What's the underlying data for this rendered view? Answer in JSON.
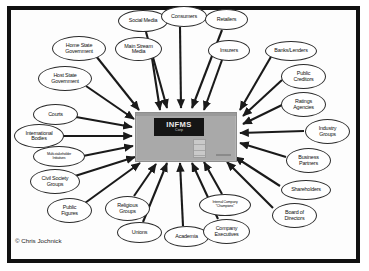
{
  "diagram": {
    "type": "stakeholder-map",
    "credit": "© Chris Jochnick",
    "frame_color": "#111111",
    "background_color": "#ffffff",
    "arrow_color": "#1a1a1a",
    "hub_color": "#a9a9a9",
    "hub": {
      "name": "INFMS",
      "sub": "Corp",
      "sign_background": "#151515",
      "sign_text_color": "#e9e9e9"
    },
    "nodes": [
      {
        "id": "social-media",
        "label": "Social Media",
        "x": 118,
        "y": 10,
        "w": 50,
        "h": 22,
        "size": "n-sm"
      },
      {
        "id": "consumers",
        "label": "Consumers",
        "x": 161,
        "y": 6,
        "w": 46,
        "h": 21,
        "size": "n-sm"
      },
      {
        "id": "retailers",
        "label": "Retailers",
        "x": 205,
        "y": 9,
        "w": 43,
        "h": 21,
        "size": "n-sm"
      },
      {
        "id": "main-stream-media",
        "label": "Main Stream\nMedia",
        "x": 115,
        "y": 37,
        "w": 47,
        "h": 24,
        "size": "n-sm"
      },
      {
        "id": "insurers",
        "label": "Insurers",
        "x": 208,
        "y": 40,
        "w": 42,
        "h": 21,
        "size": "n-sm"
      },
      {
        "id": "banks-lenders",
        "label": "Banks/Lenders",
        "x": 265,
        "y": 41,
        "w": 52,
        "h": 20,
        "size": "n-sm"
      },
      {
        "id": "public-creditors",
        "label": "Public\nCreditors",
        "x": 281,
        "y": 64,
        "w": 45,
        "h": 25,
        "size": "n-sm"
      },
      {
        "id": "ratings-agencies",
        "label": "Ratings\nAgencies",
        "x": 281,
        "y": 92,
        "w": 45,
        "h": 25,
        "size": "n-sm"
      },
      {
        "id": "industry-groups",
        "label": "Industry\nGroups",
        "x": 305,
        "y": 119,
        "w": 45,
        "h": 25,
        "size": "n-sm"
      },
      {
        "id": "business-partners",
        "label": "Business\nPartners",
        "x": 286,
        "y": 148,
        "w": 45,
        "h": 25,
        "size": "n-sm"
      },
      {
        "id": "shareholders",
        "label": "Shareholders",
        "x": 281,
        "y": 180,
        "w": 50,
        "h": 20,
        "size": "n-sm"
      },
      {
        "id": "board-of-directors",
        "label": "Board of\nDirectors",
        "x": 272,
        "y": 203,
        "w": 45,
        "h": 25,
        "size": "n-sm"
      },
      {
        "id": "home-state-government",
        "label": "Home State\nGovernment",
        "x": 52,
        "y": 36,
        "w": 54,
        "h": 25,
        "size": "n-sm"
      },
      {
        "id": "host-state-government",
        "label": "Host State\nGovernment",
        "x": 38,
        "y": 66,
        "w": 54,
        "h": 25,
        "size": "n-sm"
      },
      {
        "id": "courts",
        "label": "Courts",
        "x": 33,
        "y": 104,
        "w": 45,
        "h": 21,
        "size": "n-sm"
      },
      {
        "id": "international-bodies",
        "label": "International\nBodies",
        "x": 14,
        "y": 124,
        "w": 50,
        "h": 24,
        "size": "n-sm"
      },
      {
        "id": "multi-stakeholder",
        "label": "Multi-stakeholder\nInitiatives",
        "x": 33,
        "y": 146,
        "w": 52,
        "h": 21,
        "size": "n-xs"
      },
      {
        "id": "civil-society-groups",
        "label": "Civil Society\nGroups",
        "x": 30,
        "y": 169,
        "w": 50,
        "h": 25,
        "size": "n-sm"
      },
      {
        "id": "public-figures",
        "label": "Public\nFigures",
        "x": 47,
        "y": 198,
        "w": 45,
        "h": 25,
        "size": "n-sm"
      },
      {
        "id": "religious-groups",
        "label": "Religious\nGroups",
        "x": 105,
        "y": 196,
        "w": 45,
        "h": 25,
        "size": "n-sm"
      },
      {
        "id": "unions",
        "label": "Unions",
        "x": 117,
        "y": 222,
        "w": 45,
        "h": 21,
        "size": "n-sm"
      },
      {
        "id": "academia",
        "label": "Academia",
        "x": 164,
        "y": 226,
        "w": 45,
        "h": 21,
        "size": "n-sm"
      },
      {
        "id": "company-executives",
        "label": "Company\nExecutives",
        "x": 203,
        "y": 219,
        "w": 47,
        "h": 25,
        "size": "n-sm"
      },
      {
        "id": "internal-champions",
        "label": "Internal Company\n“Champions”",
        "x": 199,
        "y": 194,
        "w": 52,
        "h": 22,
        "size": "n-xs"
      }
    ],
    "edges": [
      {
        "from": "social-media",
        "x1": 146,
        "y1": 32,
        "x2": 167,
        "y2": 108
      },
      {
        "from": "consumers",
        "x1": 180,
        "y1": 27,
        "x2": 181,
        "y2": 108
      },
      {
        "from": "retailers",
        "x1": 222,
        "y1": 30,
        "x2": 192,
        "y2": 108
      },
      {
        "from": "main-stream-media",
        "x1": 152,
        "y1": 58,
        "x2": 160,
        "y2": 110
      },
      {
        "from": "insurers",
        "x1": 222,
        "y1": 60,
        "x2": 204,
        "y2": 110
      },
      {
        "from": "banks-lenders",
        "x1": 272,
        "y1": 55,
        "x2": 240,
        "y2": 110
      },
      {
        "from": "public-creditors",
        "x1": 282,
        "y1": 80,
        "x2": 243,
        "y2": 116
      },
      {
        "from": "ratings-agencies",
        "x1": 282,
        "y1": 105,
        "x2": 243,
        "y2": 124
      },
      {
        "from": "industry-groups",
        "x1": 304,
        "y1": 131,
        "x2": 240,
        "y2": 133
      },
      {
        "from": "business-partners",
        "x1": 286,
        "y1": 157,
        "x2": 240,
        "y2": 143
      },
      {
        "from": "shareholders",
        "x1": 280,
        "y1": 186,
        "x2": 235,
        "y2": 157
      },
      {
        "from": "board-of-directors",
        "x1": 273,
        "y1": 208,
        "x2": 227,
        "y2": 162
      },
      {
        "from": "home-state-government",
        "x1": 96,
        "y1": 56,
        "x2": 139,
        "y2": 110
      },
      {
        "from": "host-state-government",
        "x1": 86,
        "y1": 86,
        "x2": 134,
        "y2": 119
      },
      {
        "from": "courts",
        "x1": 76,
        "y1": 117,
        "x2": 132,
        "y2": 127
      },
      {
        "from": "international-bodies",
        "x1": 62,
        "y1": 136,
        "x2": 132,
        "y2": 136
      },
      {
        "from": "multi-stakeholder",
        "x1": 83,
        "y1": 156,
        "x2": 133,
        "y2": 146
      },
      {
        "from": "civil-society-groups",
        "x1": 75,
        "y1": 176,
        "x2": 135,
        "y2": 157
      },
      {
        "from": "public-figures",
        "x1": 85,
        "y1": 203,
        "x2": 140,
        "y2": 163
      },
      {
        "from": "religious-groups",
        "x1": 134,
        "y1": 196,
        "x2": 156,
        "y2": 164
      },
      {
        "from": "unions",
        "x1": 143,
        "y1": 222,
        "x2": 167,
        "y2": 163
      },
      {
        "from": "academia",
        "x1": 183,
        "y1": 226,
        "x2": 180,
        "y2": 163
      },
      {
        "from": "company-executives",
        "x1": 218,
        "y1": 219,
        "x2": 192,
        "y2": 163
      },
      {
        "from": "internal-champions",
        "x1": 222,
        "y1": 194,
        "x2": 204,
        "y2": 162
      }
    ]
  }
}
